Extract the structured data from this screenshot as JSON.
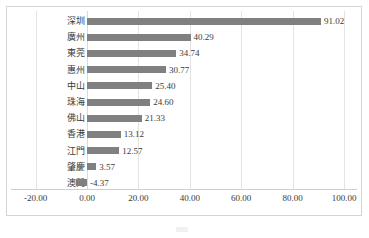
{
  "chart_data": {
    "type": "bar",
    "orientation": "horizontal",
    "title": "",
    "xlabel": "",
    "ylabel": "",
    "categories": [
      "深圳",
      "廣州",
      "東莞",
      "惠州",
      "中山",
      "珠海",
      "佛山",
      "香港",
      "江門",
      "肇慶",
      "澳門"
    ],
    "values": [
      91.02,
      40.29,
      34.74,
      30.77,
      25.4,
      24.6,
      21.33,
      13.12,
      12.57,
      3.57,
      -4.37
    ],
    "value_labels": [
      "91.02",
      "40.29",
      "34.74",
      "30.77",
      "25.40",
      "24.60",
      "21.33",
      "13.12",
      "12.57",
      "3.57",
      "-4.37"
    ],
    "xlim": [
      -20,
      100
    ],
    "xticks": [
      -20,
      0,
      20,
      40,
      60,
      80,
      100
    ],
    "xtick_labels": [
      "-20.00",
      "0.00",
      "20.00",
      "40.00",
      "60.00",
      "80.00",
      "100.00"
    ],
    "grid": true,
    "legend": "none",
    "bar_color": "#808080",
    "gridline_color": "#e3e3e3",
    "border_color": "#d4d4d4",
    "text_color": "#3a3a3a"
  },
  "caption": {
    "text": ""
  }
}
